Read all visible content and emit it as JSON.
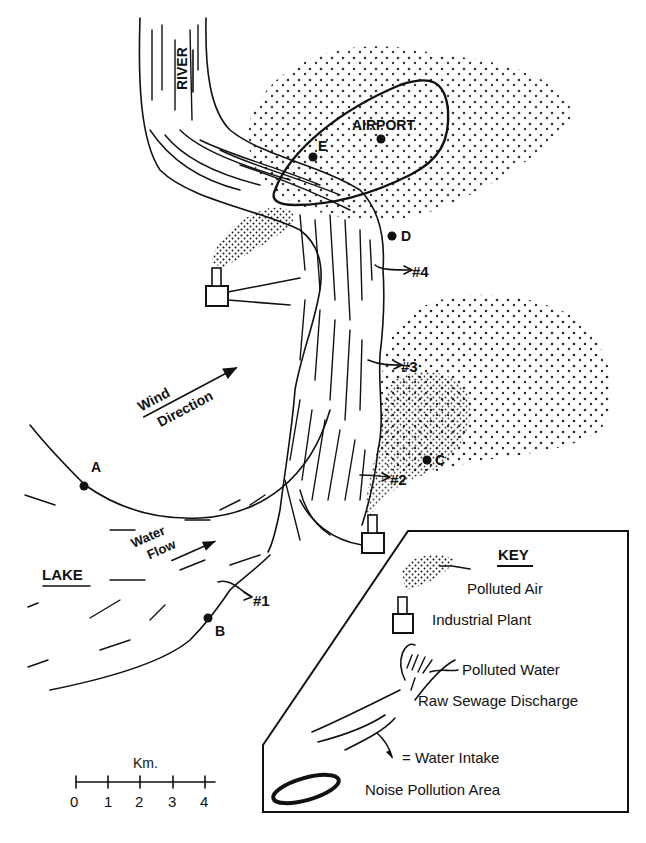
{
  "map": {
    "labels": {
      "river": "RIVER",
      "airport": "AIRPORT",
      "lake": "LAKE",
      "wind_line1": "Wind",
      "wind_line2": "Direction",
      "water_line1": "Water",
      "water_line2": "Flow"
    },
    "points": [
      {
        "id": "A",
        "label": "A"
      },
      {
        "id": "B",
        "label": "B"
      },
      {
        "id": "C",
        "label": "C"
      },
      {
        "id": "D",
        "label": "D"
      },
      {
        "id": "E",
        "label": "E"
      }
    ],
    "intakes": [
      {
        "id": "1",
        "label": "#1"
      },
      {
        "id": "2",
        "label": "#2"
      },
      {
        "id": "3",
        "label": "#3"
      },
      {
        "id": "4",
        "label": "#4"
      }
    ]
  },
  "scale": {
    "unit": "Km.",
    "ticks": [
      "0",
      "1",
      "2",
      "3",
      "4"
    ]
  },
  "key": {
    "title": "KEY",
    "items": [
      {
        "icon": "polluted-air-icon",
        "label": "Polluted Air"
      },
      {
        "icon": "industrial-plant-icon",
        "label": "Industrial Plant"
      },
      {
        "icon": "polluted-water-icon",
        "label": "Polluted Water"
      },
      {
        "icon": "sewage-discharge-icon",
        "label": "Raw Sewage Discharge"
      },
      {
        "icon": "water-intake-icon",
        "label": "= Water Intake"
      },
      {
        "icon": "noise-area-icon",
        "label": "Noise Pollution Area"
      }
    ]
  }
}
